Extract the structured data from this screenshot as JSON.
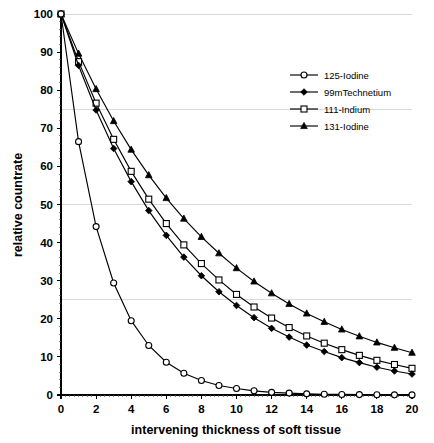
{
  "chart_data": {
    "type": "line",
    "title": "",
    "xlabel": "intervening thickness of soft tissue",
    "ylabel": "relative countrate",
    "xlim": [
      0,
      20
    ],
    "ylim": [
      0,
      100
    ],
    "xticks": [
      0,
      2,
      4,
      6,
      8,
      10,
      12,
      14,
      16,
      18,
      20
    ],
    "yticks": [
      0,
      10,
      20,
      30,
      40,
      50,
      60,
      70,
      80,
      90,
      100
    ],
    "xtick_labels": [
      "0",
      "2",
      "4",
      "6",
      "8",
      "10",
      "12",
      "14",
      "16",
      "18",
      "20"
    ],
    "ytick_labels": [
      "0",
      "10",
      "20",
      "30",
      "40",
      "50",
      "60",
      "70",
      "80",
      "90",
      "100"
    ],
    "grid": "horizontal gridlines at 25, 50, 75, 100 (light gray)",
    "gridline_values": [
      25,
      50,
      75,
      100
    ],
    "legend_position": "upper right inside plot area",
    "x": [
      0,
      1,
      2,
      3,
      4,
      5,
      6,
      7,
      8,
      9,
      10,
      11,
      12,
      13,
      14,
      15,
      16,
      17,
      18,
      19,
      20
    ],
    "series": [
      {
        "name": "125-Iodine",
        "marker": "open-circle",
        "values": [
          100,
          66.5,
          44.2,
          29.4,
          19.5,
          13.0,
          8.6,
          5.7,
          3.8,
          2.5,
          1.7,
          1.1,
          0.7,
          0.5,
          0.3,
          0.2,
          0.15,
          0.1,
          0.07,
          0.04,
          0.03
        ]
      },
      {
        "name": "99mTechnetium",
        "marker": "filled-diamond",
        "values": [
          100,
          86.5,
          74.8,
          64.7,
          56.0,
          48.4,
          41.9,
          36.2,
          31.3,
          27.1,
          23.5,
          20.3,
          17.5,
          15.2,
          13.1,
          11.4,
          9.8,
          8.5,
          7.3,
          6.3,
          5.5
        ]
      },
      {
        "name": "111-Indium",
        "marker": "open-square",
        "values": [
          100,
          87.5,
          76.6,
          67.1,
          58.7,
          51.4,
          45.0,
          39.4,
          34.5,
          30.2,
          26.4,
          23.1,
          20.2,
          17.7,
          15.5,
          13.6,
          11.9,
          10.4,
          9.1,
          8.0,
          7.0
        ]
      },
      {
        "name": "131-Iodine",
        "marker": "filled-triangle",
        "values": [
          100,
          89.6,
          80.3,
          71.9,
          64.4,
          57.7,
          51.7,
          46.3,
          41.5,
          37.2,
          33.3,
          29.8,
          26.7,
          23.9,
          21.4,
          19.2,
          17.2,
          15.4,
          13.8,
          12.4,
          11.1
        ]
      }
    ]
  },
  "legend": {
    "items": [
      {
        "label": "125-Iodine",
        "marker": "open-circle"
      },
      {
        "label": "99mTechnetium",
        "marker": "filled-diamond"
      },
      {
        "label": "111-Indium",
        "marker": "open-square"
      },
      {
        "label": "131-Iodine",
        "marker": "filled-triangle"
      }
    ]
  },
  "axes": {
    "x_title": "intervening thickness of soft tissue",
    "y_title": "relative countrate"
  }
}
